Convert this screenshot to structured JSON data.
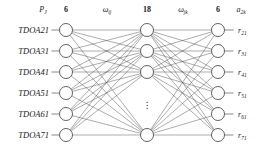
{
  "figure": {
    "type": "neural-network-diagram",
    "background_color": "#ffffff",
    "stroke_color": "#3a3a3a",
    "node_fill": "#ffffff",
    "text_color": "#1a1a1a"
  },
  "header": {
    "input_symbol": "P",
    "input_symbol_sub": "J",
    "input_count": "6",
    "weight1": "ω",
    "weight1_sub": "ij",
    "hidden_count": "18",
    "weight2": "ω",
    "weight2_sub": "jk",
    "output_count": "6",
    "output_symbol": "a",
    "output_symbol_sub": "2k"
  },
  "input_layer": {
    "count": 6,
    "labels": [
      "TDOA21",
      "TDOA31",
      "TDOA41",
      "TDOA51",
      "TDOA61",
      "TDOA71"
    ]
  },
  "hidden_layer": {
    "count_label": "18",
    "drawn_nodes": 4,
    "ellipsis": "⋮"
  },
  "output_layer": {
    "count": 6,
    "symbol": "r",
    "subscripts": [
      "21",
      "31",
      "41",
      "51",
      "61",
      "71"
    ]
  },
  "chart_data": {
    "type": "diagram",
    "title": "",
    "layers": [
      {
        "name": "input",
        "label": "P_J",
        "nodes": 6,
        "x": 66
      },
      {
        "name": "hidden",
        "label": "ω_ij → 18",
        "nodes": 18,
        "x": 147
      },
      {
        "name": "output",
        "label": "a_2k",
        "nodes": 6,
        "x": 218
      }
    ],
    "node_y_input": [
      30,
      51,
      72,
      93,
      114,
      135
    ],
    "node_y_hidden": [
      30,
      51,
      72,
      135
    ],
    "node_y_output": [
      30,
      51,
      72,
      93,
      114,
      135
    ],
    "node_radius": 6.5,
    "fully_connected": true
  }
}
